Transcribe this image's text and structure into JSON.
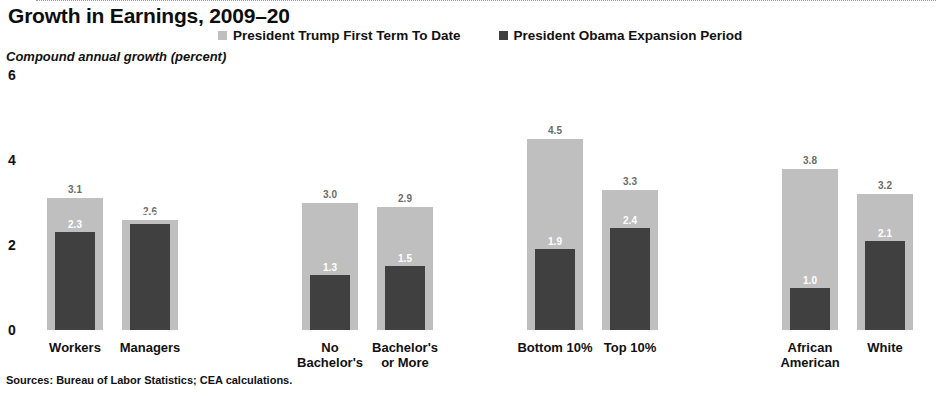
{
  "title": "Growth in Earnings, 2009–20",
  "y_axis_title": "Compound annual growth (percent)",
  "source_note": "Sources: Bureau of Labor Statistics; CEA calculations.",
  "legend": [
    {
      "label": "President Trump First Term To Date",
      "color": "#bfbfbf"
    },
    {
      "label": "President Obama Expansion Period",
      "color": "#404040"
    }
  ],
  "chart_data": {
    "type": "bar",
    "title": "Growth in Earnings, 2009–20",
    "xlabel": "",
    "ylabel": "Compound annual growth (percent)",
    "ylim": [
      0,
      6
    ],
    "yticks": [
      0,
      2,
      4,
      6
    ],
    "grid": false,
    "legend_position": "top",
    "categories": [
      "Workers",
      "Managers",
      "No Bachelor's",
      "Bachelor's or More",
      "Bottom 10%",
      "Top 10%",
      "African American",
      "White"
    ],
    "category_lines": [
      [
        "Workers"
      ],
      [
        "Managers"
      ],
      [
        "No",
        "Bachelor's"
      ],
      [
        "Bachelor's",
        "or More"
      ],
      [
        "Bottom 10%"
      ],
      [
        "Top 10%"
      ],
      [
        "African",
        "American"
      ],
      [
        "White"
      ]
    ],
    "groups": [
      [
        "Workers",
        "Managers"
      ],
      [
        "No Bachelor's",
        "Bachelor's or More"
      ],
      [
        "Bottom 10%",
        "Top 10%"
      ],
      [
        "African American",
        "White"
      ]
    ],
    "series": [
      {
        "name": "President Trump First Term To Date",
        "color": "#bfbfbf",
        "values": [
          3.1,
          2.6,
          3.0,
          2.9,
          4.5,
          3.3,
          3.8,
          3.2
        ],
        "labels": [
          "3.1",
          "2.6",
          "3.0",
          "2.9",
          "4.5",
          "3.3",
          "3.8",
          "3.2"
        ]
      },
      {
        "name": "President Obama Expansion Period",
        "color": "#404040",
        "values": [
          2.3,
          2.5,
          1.3,
          1.5,
          1.9,
          2.4,
          1.0,
          2.1
        ],
        "labels": [
          "2.3",
          "2.5",
          "1.3",
          "1.5",
          "1.9",
          "2.4",
          "1.0",
          "2.1"
        ]
      }
    ]
  },
  "layout": {
    "baseline_y": 330,
    "px_per_unit": 42.5,
    "light_bar_width": 56,
    "dark_bar_width": 40,
    "bar_centers": [
      75,
      150,
      330,
      405,
      555,
      630,
      810,
      885
    ]
  }
}
